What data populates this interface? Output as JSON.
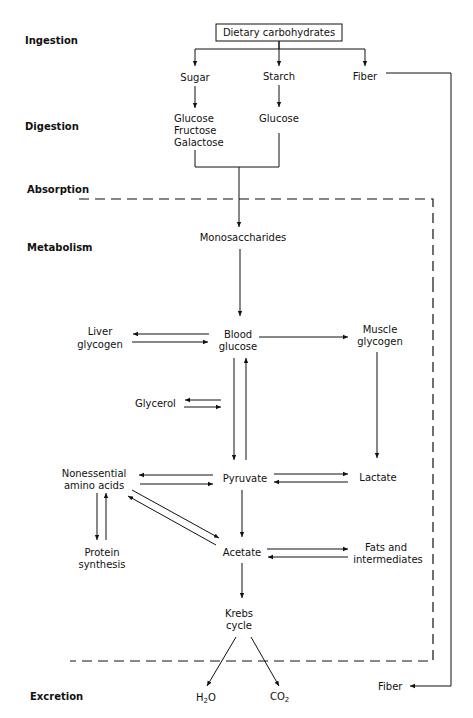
{
  "stages": {
    "ingestion": "Ingestion",
    "digestion": "Digestion",
    "absorption": "Absorption",
    "metabolism": "Metabolism",
    "excretion": "Excretion"
  },
  "nodes": {
    "dietary_carbohydrates": "Dietary carbohydrates",
    "sugar": "Sugar",
    "starch": "Starch",
    "fiber_top": "Fiber",
    "glucose_1": "Glucose",
    "fructose": "Fructose",
    "galactose": "Galactose",
    "glucose_2": "Glucose",
    "monosaccharides": "Monosaccharides",
    "liver_glycogen_1": "Liver",
    "liver_glycogen_2": "glycogen",
    "blood_glucose_1": "Blood",
    "blood_glucose_2": "glucose",
    "muscle_glycogen_1": "Muscle",
    "muscle_glycogen_2": "glycogen",
    "glycerol": "Glycerol",
    "nonessential_1": "Nonessential",
    "nonessential_2": "amino acids",
    "pyruvate": "Pyruvate",
    "lactate": "Lactate",
    "protein_1": "Protein",
    "protein_2": "synthesis",
    "acetate": "Acetate",
    "fats_1": "Fats and",
    "fats_2": "intermediates",
    "krebs_1": "Krebs",
    "krebs_2": "cycle",
    "h2o_h": "H",
    "h2o_sub": "2",
    "h2o_o": "O",
    "co2_co": "CO",
    "co2_sub": "2",
    "fiber_bottom": "Fiber"
  }
}
